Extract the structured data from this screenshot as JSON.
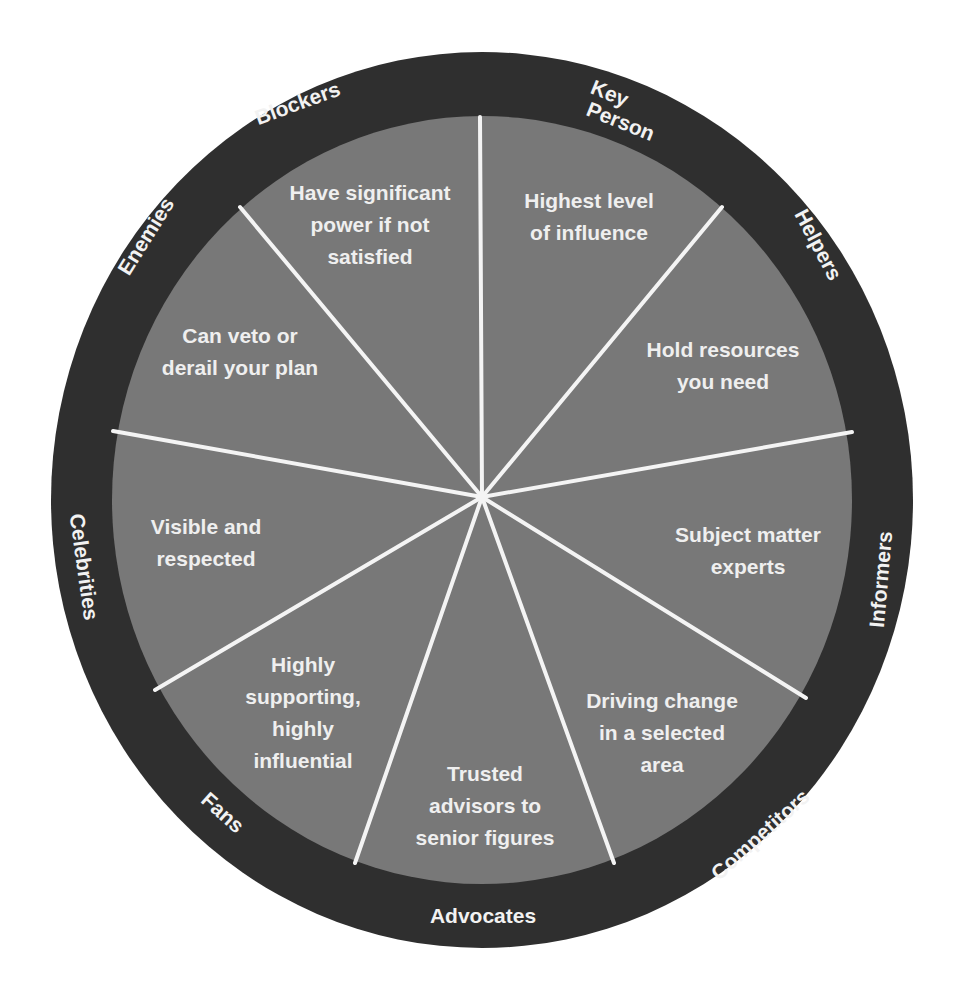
{
  "colors": {
    "ring": "#2f2f2f",
    "fill": "#787878",
    "spoke": "#f4f4f4",
    "text": "#efefef"
  },
  "segments": [
    {
      "role": "Key Person",
      "role_lines": [
        "Key",
        "Person"
      ],
      "description": "Highest level\nof influence"
    },
    {
      "role": "Helpers",
      "description": "Hold resources\nyou need"
    },
    {
      "role": "Informers",
      "description": "Subject matter\nexperts"
    },
    {
      "role": "Competitors",
      "description": "Driving change\nin a selected\narea"
    },
    {
      "role": "Advocates",
      "description": "Trusted\nadvisors to\nsenior figures"
    },
    {
      "role": "Fans",
      "description": "Highly\nsupporting,\nhighly\ninfluential"
    },
    {
      "role": "Celebrities",
      "description": "Visible and\nrespected"
    },
    {
      "role": "Enemies",
      "description": "Can veto or\nderail your plan"
    },
    {
      "role": "Blockers",
      "description": "Have significant\npower if not\nsatisfied"
    }
  ]
}
